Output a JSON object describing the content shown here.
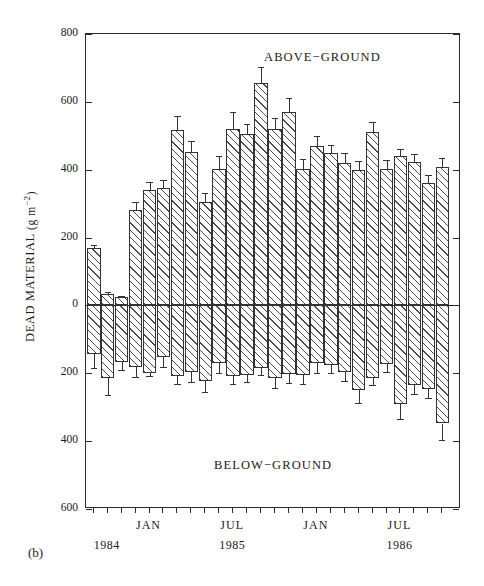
{
  "figure": {
    "panel_label": "(b)",
    "annotation_above": "ABOVE−GROUND",
    "annotation_below": "BELOW−GROUND",
    "y_axis_label_main": "DEAD MATERIAL",
    "y_axis_label_units": "(g m",
    "y_axis_label_exponent": "−2",
    "y_axis_label_close": ")",
    "axis_color": "#2a2a2a",
    "bar_fill": "#ffffff",
    "hatch_color": "#4a4a4a"
  },
  "chart_data": {
    "type": "bar",
    "title": "",
    "xlabel": "",
    "ylabel": "DEAD MATERIAL (g m−2)",
    "ylim": [
      -600,
      800
    ],
    "y_ticks": [
      800,
      600,
      400,
      200,
      0,
      -200,
      -400,
      -600
    ],
    "y_tick_labels": [
      "800",
      "600",
      "400",
      "200",
      "0",
      "200",
      "400",
      "600"
    ],
    "grid": false,
    "legend": "none",
    "annotations": [
      "ABOVE−GROUND",
      "BELOW−GROUND"
    ],
    "x_axis": {
      "minor_ticks_are_months": true,
      "month_tick_count": 26,
      "labeled_ticks": [
        {
          "label": "JAN",
          "index": 4
        },
        {
          "label": "JUL",
          "index": 10
        },
        {
          "label": "JAN",
          "index": 16
        },
        {
          "label": "JUL",
          "index": 22
        }
      ],
      "year_labels": [
        {
          "label": "1984",
          "index": 1
        },
        {
          "label": "1985",
          "index": 10
        },
        {
          "label": "1986",
          "index": 22
        }
      ]
    },
    "categories": [
      "1",
      "2",
      "3",
      "4",
      "5",
      "6",
      "7",
      "8",
      "9",
      "10",
      "11",
      "12",
      "13",
      "14",
      "15",
      "16",
      "17",
      "18",
      "19",
      "20",
      "21",
      "22",
      "23",
      "24",
      "25",
      "26"
    ],
    "series": [
      {
        "name": "Above-ground",
        "values": [
          170,
          35,
          25,
          282,
          340,
          345,
          518,
          452,
          305,
          403,
          520,
          505,
          655,
          520,
          570,
          403,
          470,
          450,
          420,
          400,
          512,
          402,
          440,
          422,
          360,
          408
        ],
        "errors": [
          8,
          5,
          4,
          22,
          25,
          26,
          40,
          32,
          26,
          38,
          50,
          30,
          48,
          32,
          42,
          30,
          28,
          22,
          30,
          26,
          30,
          28,
          22,
          24,
          24,
          26
        ]
      },
      {
        "name": "Below-ground",
        "values": [
          -143,
          -213,
          -168,
          -182,
          -200,
          -152,
          -208,
          -196,
          -222,
          -170,
          -208,
          -205,
          -183,
          -215,
          -203,
          -205,
          -170,
          -175,
          -195,
          -248,
          -215,
          -172,
          -290,
          -235,
          -245,
          -348
        ],
        "errors": [
          40,
          52,
          22,
          30,
          8,
          28,
          25,
          30,
          32,
          30,
          25,
          22,
          22,
          28,
          25,
          28,
          30,
          25,
          27,
          40,
          20,
          25,
          45,
          25,
          28,
          50
        ]
      }
    ]
  }
}
